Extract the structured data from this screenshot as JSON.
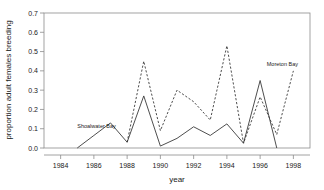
{
  "chart_data": {
    "type": "line",
    "title": "",
    "xlabel": "year",
    "ylabel": "proportion adult females breeding",
    "xlim": [
      1983,
      1999
    ],
    "ylim": [
      0.0,
      0.7
    ],
    "grid": false,
    "legend_position": "inline-annotations",
    "xticks": [
      1984,
      1986,
      1988,
      1990,
      1992,
      1994,
      1996,
      1998
    ],
    "xtick_labels": [
      "1984",
      "1986",
      "1988",
      "1990",
      "1992",
      "1994",
      "1996",
      "1998"
    ],
    "yticks": [
      0.0,
      0.1,
      0.2,
      0.3,
      0.4,
      0.5,
      0.6,
      0.7
    ],
    "ytick_labels": [
      "0.0",
      "0.1",
      "0.2",
      "0.3",
      "0.4",
      "0.5",
      "0.6",
      "0.7"
    ],
    "series": [
      {
        "name": "Shoalwater Bay",
        "style": "solid",
        "color": "#3a3a3a",
        "x": [
          1985,
          1986,
          1987,
          1988,
          1989,
          1990,
          1991,
          1992,
          1993,
          1994,
          1995,
          1996,
          1997
        ],
        "values": [
          0.0,
          0.065,
          0.13,
          0.03,
          0.27,
          0.01,
          0.05,
          0.11,
          0.065,
          0.125,
          0.025,
          0.35,
          0.0
        ]
      },
      {
        "name": "Moreton Bay",
        "style": "dashed",
        "color": "#3a3a3a",
        "x": [
          1988,
          1989,
          1990,
          1991,
          1992,
          1993,
          1994,
          1995,
          1996,
          1997,
          1998
        ],
        "values": [
          0.03,
          0.45,
          0.09,
          0.3,
          0.24,
          0.145,
          0.53,
          0.025,
          0.265,
          0.07,
          0.4
        ]
      }
    ],
    "annotations": [
      {
        "text": "Shoalwater Bay",
        "x": 1985.0,
        "y": 0.105,
        "anchor": "start"
      },
      {
        "text": "Moreton Bay",
        "x": 1996.4,
        "y": 0.425,
        "anchor": "start"
      }
    ]
  }
}
